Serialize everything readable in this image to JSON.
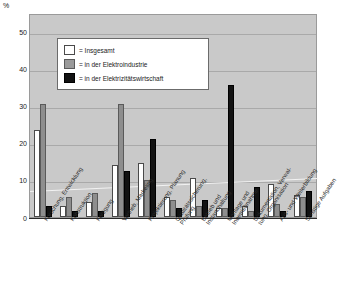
{
  "axis": {
    "unit": "%",
    "yticks": [
      "50",
      "40",
      "30",
      "20",
      "10",
      "0"
    ],
    "ymin": 0,
    "ymax": 55
  },
  "legend": {
    "items": [
      {
        "key": "s0",
        "marker": "=",
        "label": "= Insgesamt"
      },
      {
        "key": "s1",
        "marker": "=",
        "label": "= in der Elektroindustrie"
      },
      {
        "key": "s2",
        "marker": "=",
        "label": "= in der Elektrizitätswirtschaft"
      }
    ]
  },
  "colors": {
    "series_insgesamt": "#ffffff",
    "series_elektroindustrie": "#8e8e8e",
    "series_elektrizitaetswirtschaft": "#121212",
    "plot_background": "#c9c9c9",
    "gridline": "#a9a9a9"
  },
  "chart_data": {
    "type": "bar",
    "title": "",
    "xlabel": "",
    "ylabel": "%",
    "ylim": [
      0,
      55
    ],
    "yticks": [
      0,
      10,
      20,
      30,
      40,
      50
    ],
    "grid": true,
    "legend_position": "inside-top-left",
    "categories": [
      "Forschung, Entwicklung",
      "Konstruktion",
      "Fertigung",
      "Vertrieb, Marketing",
      "Projektierung, Planung",
      "Qualitätssicherung,\nPrüfung",
      "Betrieb und\nInstandhaltung",
      "Montage und\nInbetriebnahme",
      "Dokumentation, Verwal-\ntung, Organisation",
      "Aus- und Weiterbildung",
      "Sonstige Aufgaben"
    ],
    "series": [
      {
        "name": "Insgesamt",
        "values": [
          23.5,
          3.0,
          4.0,
          14.0,
          14.5,
          5.5,
          10.5,
          2.5,
          3.0,
          9.0,
          6.0
        ]
      },
      {
        "name": "in der Elektroindustrie",
        "values": [
          30.5,
          5.5,
          6.5,
          30.5,
          10.0,
          4.5,
          3.0,
          2.5,
          1.5,
          3.5,
          5.5
        ]
      },
      {
        "name": "in der Elektrizitätswirtschaft",
        "values": [
          3.0,
          1.5,
          1.5,
          12.5,
          21.0,
          2.5,
          4.5,
          35.5,
          8.0,
          1.5,
          7.0
        ]
      }
    ]
  }
}
